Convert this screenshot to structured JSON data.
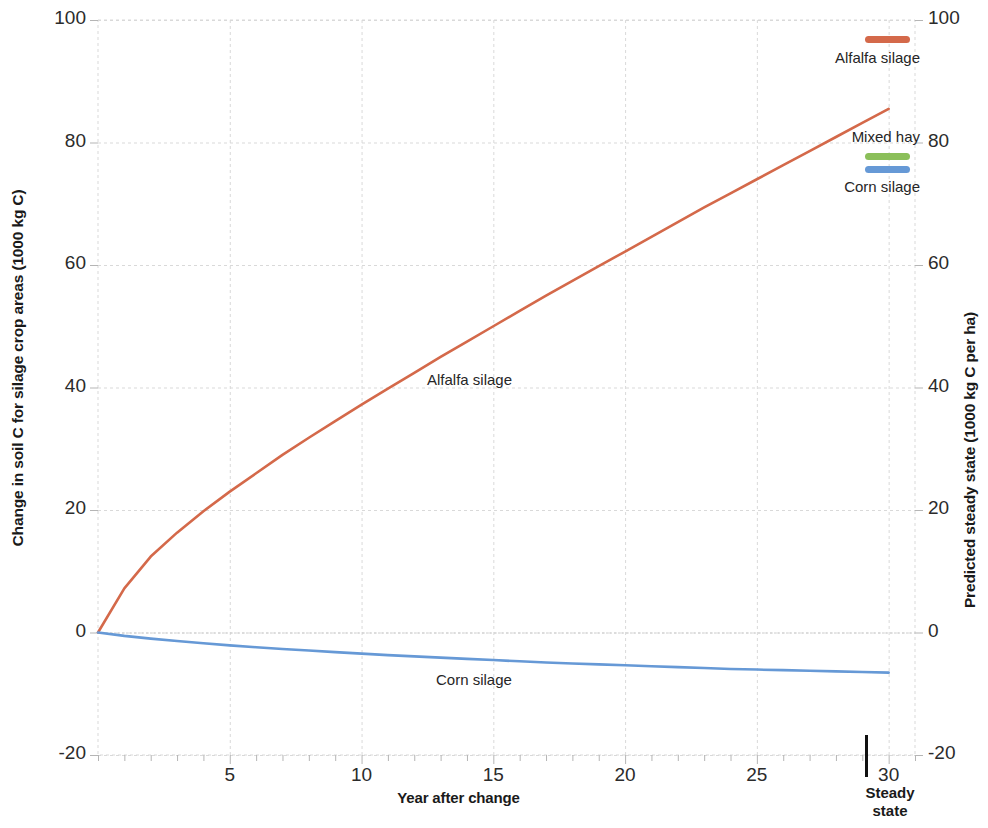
{
  "chart_data": {
    "type": "line",
    "title": "",
    "xlabel": "Year after change",
    "ylabel": "Change in soil C for silage crop areas (1000 kg C)",
    "y2label": "Predicted steady state (1000 kg C per ha)",
    "xlim": [
      0,
      31
    ],
    "ylim": [
      -20,
      100
    ],
    "y2lim": [
      -20,
      100
    ],
    "grid": true,
    "legend_position": "top-right",
    "x_tick_labels": [
      "5",
      "10",
      "15",
      "20",
      "25",
      "30"
    ],
    "x_tick_values": [
      5,
      10,
      15,
      20,
      25,
      30
    ],
    "x_minor_tick_step": 1,
    "y_tick_labels": [
      "-20",
      "0",
      "20",
      "40",
      "60",
      "80",
      "100"
    ],
    "y_tick_values": [
      -20,
      0,
      20,
      40,
      60,
      80,
      100
    ],
    "y2_tick_labels": [
      "-20",
      "0",
      "20",
      "40",
      "60",
      "80",
      "100"
    ],
    "y2_tick_values": [
      -20,
      0,
      20,
      40,
      60,
      80,
      100
    ],
    "annotations": [
      {
        "text": "Alfalfa silage",
        "x": 13.0,
        "y": 42.0
      },
      {
        "text": "Corn silage",
        "x": 13.5,
        "y": -10.5
      },
      {
        "text": "Steady state",
        "x": 31.0,
        "y": -20.0
      }
    ],
    "series": [
      {
        "name": "Alfalfa silage",
        "color": "#d4694a",
        "x": [
          0,
          1,
          2,
          3,
          4,
          5,
          6,
          7,
          8,
          9,
          10,
          11,
          12,
          13,
          14,
          15,
          16,
          17,
          18,
          19,
          20,
          21,
          22,
          23,
          24,
          25,
          26,
          27,
          28,
          29,
          30
        ],
        "values": [
          0,
          7.2,
          12.4,
          16.3,
          19.8,
          23.0,
          26.0,
          29.0,
          31.8,
          34.5,
          37.2,
          39.8,
          42.4,
          45.0,
          47.5,
          50.0,
          52.5,
          55.0,
          57.4,
          59.8,
          62.2,
          64.6,
          67.0,
          69.4,
          71.7,
          74.0,
          76.3,
          78.6,
          80.9,
          83.2,
          85.5
        ],
        "steady_state": 87.0
      },
      {
        "name": "Mixed hay",
        "color": "#8bbf5a",
        "x": [
          0,
          5,
          10,
          15,
          20,
          25,
          30
        ],
        "values": [
          0,
          0,
          0,
          0,
          0,
          0,
          0
        ],
        "steady_state": 0
      },
      {
        "name": "Corn silage",
        "color": "#6699d6",
        "x": [
          0,
          1,
          2,
          3,
          4,
          5,
          6,
          7,
          8,
          9,
          10,
          11,
          12,
          13,
          14,
          15,
          16,
          17,
          18,
          19,
          20,
          21,
          22,
          23,
          24,
          25,
          26,
          27,
          28,
          29,
          30
        ],
        "values": [
          0,
          -0.55,
          -1.0,
          -1.4,
          -1.75,
          -2.1,
          -2.4,
          -2.7,
          -2.95,
          -3.2,
          -3.45,
          -3.7,
          -3.9,
          -4.1,
          -4.3,
          -4.5,
          -4.7,
          -4.9,
          -5.05,
          -5.2,
          -5.35,
          -5.5,
          -5.65,
          -5.8,
          -5.95,
          -6.05,
          -6.15,
          -6.25,
          -6.35,
          -6.45,
          -6.55
        ],
        "steady_state": -6.6
      }
    ]
  },
  "axes": {
    "x_title": "Year after change",
    "y_left_title": "Change in soil C for silage crop areas (1000 kg C)",
    "y_right_title": "Predicted steady state (1000 kg C per ha)",
    "x_ticks": [
      "5",
      "10",
      "15",
      "20",
      "25",
      "30"
    ],
    "y_left_ticks": [
      "100",
      "80",
      "60",
      "40",
      "20",
      "0",
      "-20"
    ],
    "y_right_ticks": [
      "100",
      "80",
      "60",
      "40",
      "20",
      "0",
      "-20"
    ]
  },
  "steady_state": {
    "label_line1": "Steady",
    "label_line2": "state"
  },
  "legend": {
    "items": [
      {
        "label": "Alfalfa silage",
        "color": "#d4694a"
      },
      {
        "label": "Mixed hay",
        "color": "#8bbf5a"
      },
      {
        "label": "Corn silage",
        "color": "#6699d6"
      }
    ]
  },
  "plot_annotations": {
    "alfalfa": "Alfalfa silage",
    "corn": "Corn silage"
  },
  "colors": {
    "alfalfa": "#d4694a",
    "mixed_hay": "#8bbf5a",
    "corn": "#6699d6",
    "grid": "#d9d9d9",
    "text": "#262626"
  }
}
